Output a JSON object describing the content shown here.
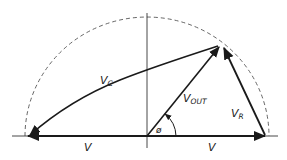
{
  "diagram": {
    "type": "phasor-diagram",
    "colors": {
      "stroke": "#1a1a1a",
      "dashed_arc": "#555555",
      "axis": "#333333",
      "background": "#ffffff"
    },
    "labels": {
      "vc_main": "V",
      "vc_sub": "C",
      "vout_main": "V",
      "vout_sub": "OUT",
      "vr_main": "V",
      "vr_sub": "R",
      "phi": "ø",
      "v_left": "V",
      "v_right": "V"
    },
    "vectors": [
      {
        "name": "V_C",
        "from": "apex",
        "to": "left-end"
      },
      {
        "name": "V_OUT",
        "from": "origin",
        "to": "apex"
      },
      {
        "name": "V_R",
        "from": "right-end",
        "to": "apex"
      },
      {
        "name": "V (left)",
        "from": "origin",
        "to": "left-end"
      },
      {
        "name": "V (right)",
        "from": "origin",
        "to": "right-end"
      }
    ],
    "angle": "ø between V_OUT and horizontal axis"
  }
}
